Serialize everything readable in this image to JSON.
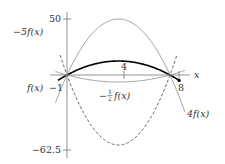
{
  "chart_data": {
    "type": "line",
    "title": "",
    "xlabel": "x",
    "ylabel": "",
    "base_function": "f(x) = -(50/81)(x+1)(x-8)",
    "roots": [
      -1,
      8
    ],
    "vertex": {
      "x": 3.5,
      "f": 12.5
    },
    "x_ticks": [
      {
        "value": -1,
        "label": "-1"
      },
      {
        "value": 4,
        "label": "4"
      },
      {
        "value": 8,
        "label": "8"
      }
    ],
    "y_ticks": [
      {
        "value": 50,
        "label": "50"
      },
      {
        "value": -62.5,
        "label": "-62.5"
      }
    ],
    "xlim": [
      -2.3,
      9.5
    ],
    "ylim": [
      -65,
      55
    ],
    "grid": false,
    "legend": "inline labels",
    "series": [
      {
        "name": "f(x)",
        "scale": 1,
        "style": "solid-bold",
        "color": "#000000",
        "max": 12.5
      },
      {
        "name": "4f(x)",
        "scale": 4,
        "style": "solid-thin",
        "color": "#8a8a8a",
        "max": 50
      },
      {
        "name": "-1/2 f(x)",
        "scale": -0.5,
        "style": "solid-thin",
        "color": "#8a8a8a",
        "min": -6.25
      },
      {
        "name": "-5f(x)",
        "scale": -5,
        "style": "dashed",
        "color": "#555555",
        "min": -62.5
      }
    ]
  },
  "labels": {
    "x_axis": "x",
    "y_tick_top": "50",
    "y_tick_bottom": "−62.5",
    "x_tick_left": "−1",
    "x_tick_mid": "4",
    "x_tick_right": "8",
    "f": "f(x)",
    "four_f": "4f(x)",
    "neg_half_f_prefix": "−",
    "neg_half_f_num": "1",
    "neg_half_f_den": "2",
    "neg_half_f_suffix": "f(x)",
    "neg_five_f": "−5f(x)"
  }
}
